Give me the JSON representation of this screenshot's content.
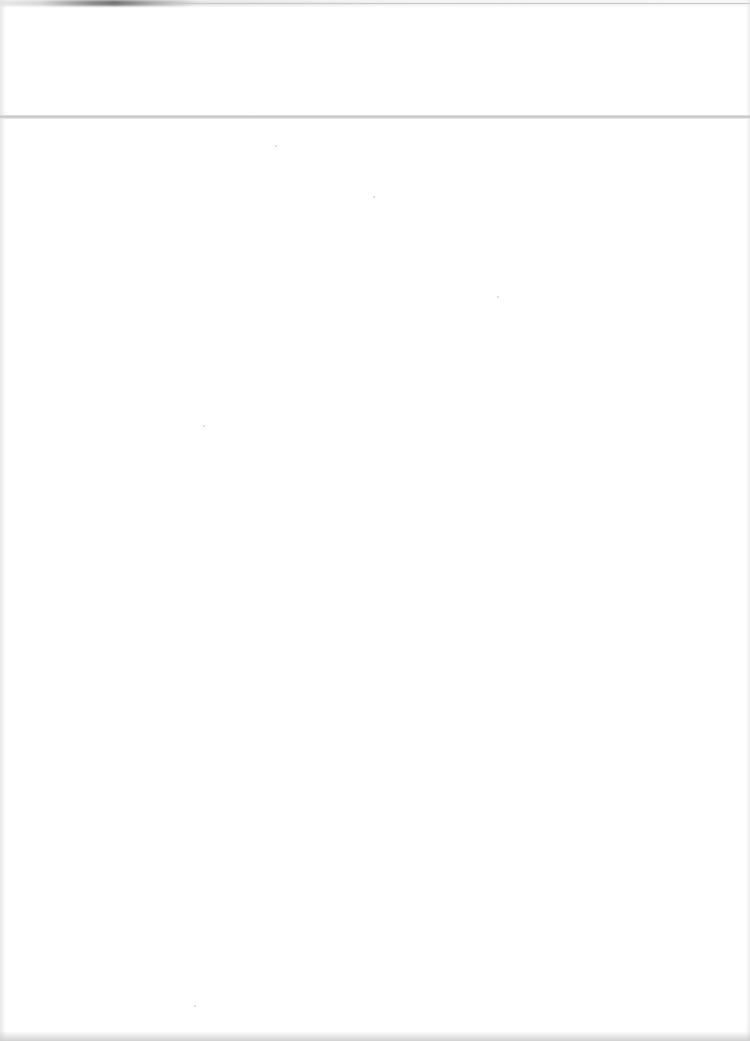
{
  "document": {
    "type": "blank scanned page",
    "text_content": "",
    "has_fold_line": true,
    "colors": {
      "paper": "#ffffff",
      "fold_line": "#c4c4c4",
      "edge_shadow": "#6e6e6e"
    }
  }
}
